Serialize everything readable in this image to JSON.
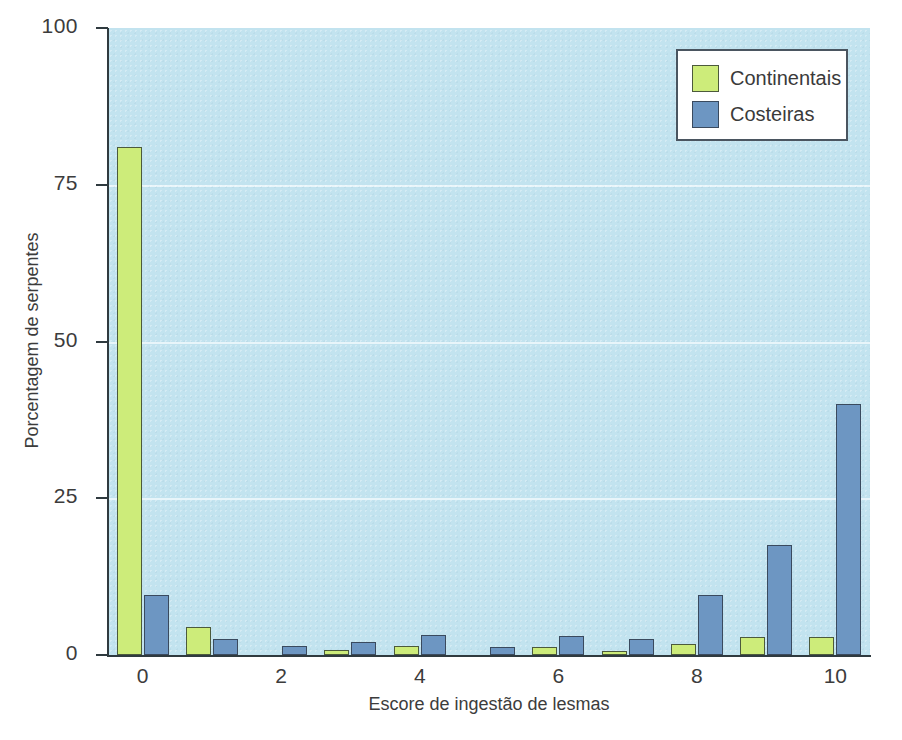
{
  "chart_data": {
    "type": "bar",
    "title": "",
    "xlabel": "Escore de ingestão de lesmas",
    "ylabel": "Porcentagem de serpentes",
    "categories": [
      "0",
      "1",
      "2",
      "3",
      "4",
      "5",
      "6",
      "7",
      "8",
      "9",
      "10"
    ],
    "x_ticks": [
      "0",
      "2",
      "4",
      "6",
      "8",
      "10"
    ],
    "y_ticks": [
      "0",
      "25",
      "50",
      "75",
      "100"
    ],
    "xlim": [
      -0.5,
      10.5
    ],
    "ylim": [
      0,
      100
    ],
    "grid": "horizontal",
    "legend_position": "top-right",
    "series": [
      {
        "name": "Continentais",
        "color": "#cdec78",
        "values": [
          81,
          4.5,
          0,
          0.8,
          1.5,
          0,
          1.2,
          0.6,
          1.8,
          2.8,
          2.8
        ]
      },
      {
        "name": "Costeiras",
        "color": "#6d96c2",
        "values": [
          9.5,
          2.5,
          1.5,
          2,
          3.2,
          1.2,
          3,
          2.6,
          9.5,
          17.5,
          40
        ]
      }
    ]
  },
  "legend": {
    "items": [
      {
        "label": "Continentais",
        "swatch": "green-swatch"
      },
      {
        "label": "Costeiras",
        "swatch": "blue-swatch"
      }
    ]
  },
  "colors": {
    "plot_background": "#c2e3ef",
    "green_bar": "#cdec78",
    "blue_bar": "#6d96c2",
    "axis": "#2f3a3f",
    "gridline": "#eef8fb"
  }
}
